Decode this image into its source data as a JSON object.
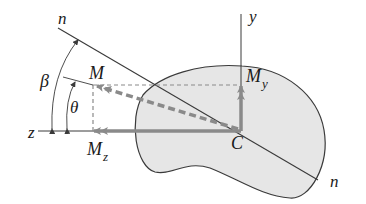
{
  "figure": {
    "type": "bending-moment-vector-diagram",
    "colors": {
      "background": "#ffffff",
      "shape_fill": "#e6e6e6",
      "shape_stroke": "#3a3a3a",
      "axis": "#3a3a3a",
      "arrow": "#8a8a8a",
      "dashed": "#8a8a8a",
      "text": "#1a1a1a"
    },
    "labels": {
      "n_top": "n",
      "n_bottom": "n",
      "y_axis": "y",
      "z_axis": "z",
      "beta": "β",
      "theta": "θ",
      "moment": "M",
      "moment_y": "M",
      "moment_y_sub": "y",
      "moment_z": "M",
      "moment_z_sub": "z",
      "centroid": "C"
    }
  }
}
